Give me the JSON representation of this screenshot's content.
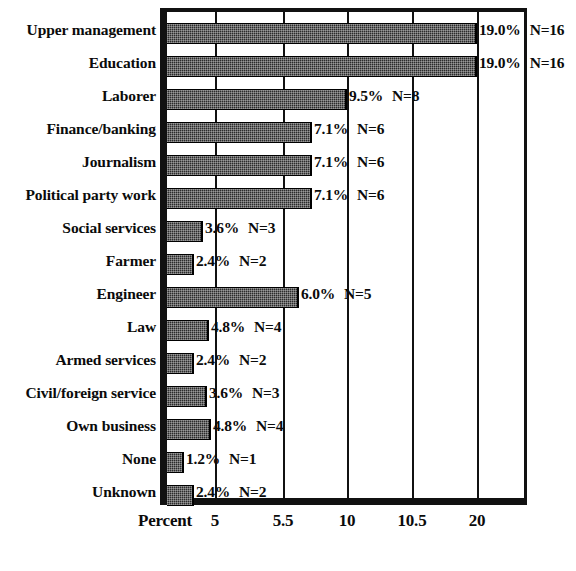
{
  "chart_data": {
    "type": "bar",
    "orientation": "horizontal",
    "title": "",
    "subtitle": "",
    "xlabel": "Percent",
    "ylabel": "",
    "grid": true,
    "legend": null,
    "axis_note": "Non-linear x axis: tick labels 5, 5.5, 10, 10.5, 20 are evenly spaced",
    "xticks": [
      {
        "label": "5",
        "value": 5,
        "px": 48
      },
      {
        "label": "5.5",
        "value": 5.5,
        "px": 116
      },
      {
        "label": "10",
        "value": 10,
        "px": 180
      },
      {
        "label": "10.5",
        "value": 10.5,
        "px": 245
      },
      {
        "label": "20",
        "value": 20,
        "px": 310
      }
    ],
    "categories": [
      "Upper management",
      "Education",
      "Laborer",
      "Finance/banking",
      "Journalism",
      "Political party work",
      "Social services",
      "Farmer",
      "Engineer",
      "Law",
      "Armed services",
      "Civil/foreign service",
      "Own business",
      "None",
      "Unknown"
    ],
    "values": [
      19.0,
      19.0,
      9.5,
      7.1,
      7.1,
      7.1,
      3.6,
      2.4,
      6.0,
      4.8,
      2.4,
      3.6,
      4.8,
      1.2,
      2.4
    ],
    "counts": [
      16,
      16,
      8,
      6,
      6,
      6,
      3,
      2,
      5,
      4,
      2,
      3,
      4,
      1,
      2
    ],
    "percent_labels": [
      "19.0%",
      "19.0%",
      "9.5%",
      "7.1%",
      "7.1%",
      "7.1%",
      "3.6%",
      "2.4%",
      "6.0%",
      "4.8%",
      "2.4%",
      "3.6%",
      "4.8%",
      "1.2%",
      "2.4%"
    ],
    "count_labels": [
      "N=16",
      "N=16",
      "N=8",
      "N=6",
      "N=6",
      "N=6",
      "N=3",
      "N=2",
      "N=5",
      "N=4",
      "N=2",
      "N=3",
      "N=4",
      "N=1",
      "N=2"
    ],
    "bar_pixel_widths": [
      310,
      310,
      180,
      145,
      145,
      145,
      36,
      27,
      132,
      42,
      27,
      40,
      44,
      17,
      27
    ],
    "colors": {
      "bar_fill": "#2b2b2b",
      "axis": "#111111",
      "text": "#0b0b0b",
      "background": "#ffffff"
    }
  },
  "rows": [
    {
      "label": "Upper management",
      "percent": "19.0%",
      "count": "N=16"
    },
    {
      "label": "Education",
      "percent": "19.0%",
      "count": "N=16"
    },
    {
      "label": "Laborer",
      "percent": "9.5%",
      "count": "N=8"
    },
    {
      "label": "Finance/banking",
      "percent": "7.1%",
      "count": "N=6"
    },
    {
      "label": "Journalism",
      "percent": "7.1%",
      "count": "N=6"
    },
    {
      "label": "Political party work",
      "percent": "7.1%",
      "count": "N=6"
    },
    {
      "label": "Social services",
      "percent": "3.6%",
      "count": "N=3"
    },
    {
      "label": "Farmer",
      "percent": "2.4%",
      "count": "N=2"
    },
    {
      "label": "Engineer",
      "percent": "6.0%",
      "count": "N=5"
    },
    {
      "label": "Law",
      "percent": "4.8%",
      "count": "N=4"
    },
    {
      "label": "Armed services",
      "percent": "2.4%",
      "count": "N=2"
    },
    {
      "label": "Civil/foreign service",
      "percent": "3.6%",
      "count": "N=3"
    },
    {
      "label": "Own business",
      "percent": "4.8%",
      "count": "N=4"
    },
    {
      "label": "None",
      "percent": "1.2%",
      "count": "N=1"
    },
    {
      "label": "Unknown",
      "percent": "2.4%",
      "count": "N=2"
    }
  ],
  "axis": {
    "title": "Percent",
    "ticks": [
      "5",
      "5.5",
      "10",
      "10.5",
      "20"
    ]
  }
}
